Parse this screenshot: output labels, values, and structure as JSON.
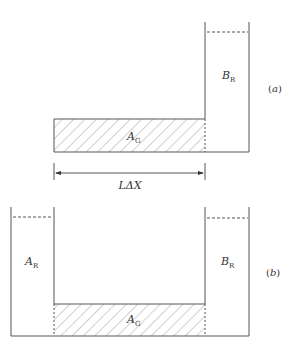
{
  "diagram": {
    "panel_a": {
      "id_label": "(a)",
      "id_letter": "a",
      "reservoir_label": {
        "main": "B",
        "sub": "R"
      },
      "gel_label": {
        "main": "A",
        "sub": "G"
      }
    },
    "dimension": {
      "label": "LΔX"
    },
    "panel_b": {
      "id_label": "(b)",
      "id_letter": "b",
      "left_reservoir_label": {
        "main": "A",
        "sub": "R"
      },
      "right_reservoir_label": {
        "main": "B",
        "sub": "R"
      },
      "gel_label": {
        "main": "A",
        "sub": "G"
      }
    },
    "colors": {
      "line": "#555555",
      "hatch": "#888888",
      "background": "#ffffff"
    }
  }
}
